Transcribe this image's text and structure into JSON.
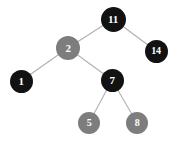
{
  "diagram": {
    "type": "binary-tree",
    "background_color": "#ffffff",
    "edge_color": "#b0b0b0",
    "label_color": "#ffffff",
    "colors": {
      "black_node": "#121212",
      "red_node": "#7d7d7d"
    },
    "nodes": [
      {
        "id": "n11",
        "label": "11",
        "color_class": "black",
        "fill": "#121212",
        "cx": 113,
        "cy": 19,
        "r": 12.5,
        "font_size": 11
      },
      {
        "id": "n2",
        "label": "2",
        "color_class": "red",
        "fill": "#7d7d7d",
        "cx": 68,
        "cy": 48,
        "r": 12.0,
        "font_size": 11
      },
      {
        "id": "n14",
        "label": "14",
        "color_class": "black",
        "fill": "#121212",
        "cx": 156,
        "cy": 51,
        "r": 11.5,
        "font_size": 10
      },
      {
        "id": "n1",
        "label": "1",
        "color_class": "black",
        "fill": "#121212",
        "cx": 21,
        "cy": 81,
        "r": 11.5,
        "font_size": 11
      },
      {
        "id": "n7",
        "label": "7",
        "color_class": "black",
        "fill": "#121212",
        "cx": 112,
        "cy": 80,
        "r": 11.5,
        "font_size": 11
      },
      {
        "id": "n5",
        "label": "5",
        "color_class": "red",
        "fill": "#7d7d7d",
        "cx": 89,
        "cy": 123,
        "r": 11.0,
        "font_size": 10
      },
      {
        "id": "n8",
        "label": "8",
        "color_class": "red",
        "fill": "#7d7d7d",
        "cx": 137,
        "cy": 123,
        "r": 11.0,
        "font_size": 10
      }
    ],
    "edges": [
      {
        "id": "e-11-2",
        "from": "n11",
        "to": "n2",
        "x1": 113,
        "y1": 19,
        "x2": 68,
        "y2": 48
      },
      {
        "id": "e-11-14",
        "from": "n11",
        "to": "n14",
        "x1": 113,
        "y1": 19,
        "x2": 156,
        "y2": 51
      },
      {
        "id": "e-2-1",
        "from": "n2",
        "to": "n1",
        "x1": 68,
        "y1": 48,
        "x2": 21,
        "y2": 81
      },
      {
        "id": "e-2-7",
        "from": "n2",
        "to": "n7",
        "x1": 68,
        "y1": 48,
        "x2": 112,
        "y2": 80
      },
      {
        "id": "e-7-5",
        "from": "n7",
        "to": "n5",
        "x1": 112,
        "y1": 80,
        "x2": 89,
        "y2": 123
      },
      {
        "id": "e-7-8",
        "from": "n7",
        "to": "n8",
        "x1": 112,
        "y1": 80,
        "x2": 137,
        "y2": 123
      }
    ]
  }
}
